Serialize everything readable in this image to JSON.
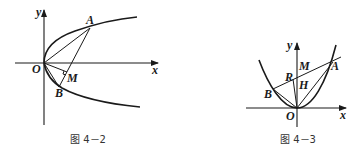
{
  "figures": [
    {
      "id": "fig-4-2",
      "caption": "图 4－2",
      "labels": {
        "y": "y",
        "x": "x",
        "O": "O",
        "A": "A",
        "B": "B",
        "M": "M"
      },
      "description": "Parabola opening rightward (y^2 = 2px) with chords OA, OB, AB; M is foot of perpendicular from O to AB"
    },
    {
      "id": "fig-4-3",
      "caption": "图 4－3",
      "labels": {
        "y": "y",
        "x": "x",
        "O": "O",
        "A": "A",
        "B": "B",
        "M": "M",
        "R": "R",
        "H": "H"
      },
      "description": "Parabola opening upward with chord AB, segments OA, OB, OR; H on y-axis, M on AB"
    }
  ],
  "colors": {
    "ink": "#1a1a1a",
    "background": "#ffffff"
  }
}
